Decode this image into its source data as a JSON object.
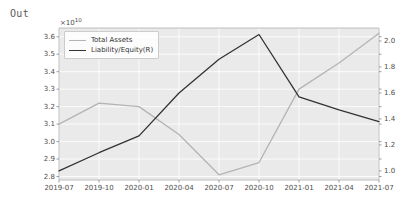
{
  "prompt": {
    "label": "Out"
  },
  "figure": {
    "offset_label": "×10",
    "offset_exponent": "10",
    "background": "#eaeaea",
    "grid_color": "#ffffff",
    "axis_color": "#b0b0b0"
  },
  "legend": {
    "position": "upper-left",
    "items": [
      {
        "label": "Total Assets",
        "color": "#b4b4b4"
      },
      {
        "label": "Liability/Equity(R)",
        "color": "#333333"
      }
    ]
  },
  "chart_data": {
    "type": "line",
    "title": "",
    "xlabel": "",
    "ylabel": "",
    "grid": true,
    "x": [
      "2019-07",
      "2019-10",
      "2020-01",
      "2020-04",
      "2020-07",
      "2020-10",
      "2021-01",
      "2021-04",
      "2021-07"
    ],
    "xticklabels": [
      "2019-07",
      "2019-10",
      "2020-01",
      "2020-04",
      "2020-07",
      "2020-10",
      "2021-01",
      "2021-04",
      "2021-07"
    ],
    "left_axis": {
      "ylim": [
        2.78,
        3.65
      ],
      "yticks": [
        2.8,
        2.9,
        3.0,
        3.1,
        3.2,
        3.3,
        3.4,
        3.5,
        3.6
      ],
      "yticklabels": [
        "2.8",
        "2.9",
        "3.0",
        "3.1",
        "3.2",
        "3.3",
        "3.4",
        "3.5",
        "3.6"
      ],
      "scale_offset": "1e10"
    },
    "right_axis": {
      "ylim": [
        0.93,
        2.1
      ],
      "yticks": [
        1.0,
        1.2,
        1.4,
        1.6,
        1.8,
        2.0
      ],
      "yticklabels": [
        "1.0",
        "1.2",
        "1.4",
        "1.6",
        "1.8",
        "2.0"
      ]
    },
    "series": [
      {
        "name": "Total Assets",
        "axis": "left",
        "color": "#b4b4b4",
        "unit": "1e10",
        "values": [
          3.1,
          3.22,
          3.2,
          3.04,
          2.81,
          2.88,
          3.3,
          3.45,
          3.62
        ]
      },
      {
        "name": "Liability/Equity(R)",
        "axis": "right",
        "color": "#333333",
        "values": [
          1.0,
          1.14,
          1.27,
          1.6,
          1.86,
          2.05,
          1.57,
          1.47,
          1.38
        ]
      }
    ]
  }
}
